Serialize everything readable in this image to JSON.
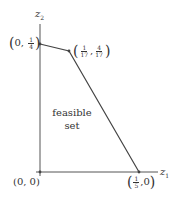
{
  "axes": {
    "x_label": "z",
    "x_sub": "1",
    "y_label": "z",
    "y_sub": "2"
  },
  "points": {
    "origin": {
      "text": "(0, 0)"
    },
    "top": {
      "open": "(",
      "pre": "0, ",
      "num": "1",
      "den": "4",
      "close": ")"
    },
    "vertex": {
      "open": "(",
      "num1": "1",
      "den1": "17",
      "sep": ",",
      "num2": "4",
      "den2": "17",
      "close": ")"
    },
    "right": {
      "open": "(",
      "num": "1",
      "den": "5",
      "post": ",0",
      "close": ")"
    }
  },
  "region": {
    "line1": "feasible",
    "line2": "set"
  },
  "colors": {
    "stroke": "#444444",
    "text": "#333333"
  }
}
